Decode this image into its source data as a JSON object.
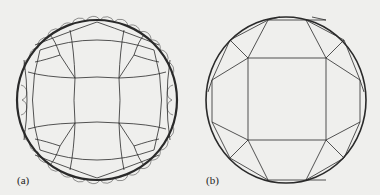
{
  "figure": {
    "panels": [
      {
        "label": "(a)",
        "description": "Hyperbolic tiling in Poincaré disk model"
      },
      {
        "label": "(b)",
        "description": "Hyperbolic tiling in Klein disk model"
      }
    ]
  },
  "colors": {
    "background": "#efefed",
    "stroke": "#2a2a2a"
  }
}
